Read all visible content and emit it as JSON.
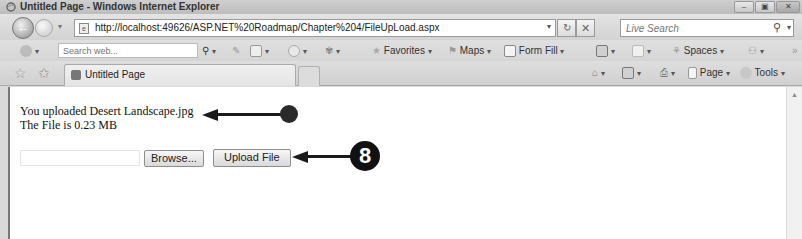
{
  "window": {
    "title": "Untitled Page - Windows Internet Explorer",
    "controls": {
      "minimize": "–",
      "maximize": "▣",
      "close": "✕"
    }
  },
  "address_bar": {
    "url": "http://localhost:49626/ASP.NET%20Roadmap/Chapter%204/FileUpLoad.aspx",
    "refresh_icon": "refresh-icon",
    "stop_icon": "stop-icon",
    "refresh_glyph": "↻",
    "stop_glyph": "✕",
    "dropdown_glyph": "▾"
  },
  "live_search": {
    "placeholder": "Live Search",
    "search_glyph": "⚲",
    "dropdown_glyph": "▾"
  },
  "toolbar": {
    "web_search_placeholder": "Search web...",
    "favorites_label": "Favorites",
    "maps_label": "Maps",
    "form_fill_label": "Form Fill",
    "spaces_label": "Spaces",
    "star_glyph": "★",
    "dropdown_glyph": "▾"
  },
  "tabs": {
    "favorites_center_glyph": "☆",
    "add_favorites_glyph": "✩",
    "items": [
      {
        "label": "Untitled Page",
        "active": true
      }
    ]
  },
  "command_bar": {
    "page_label": "Page",
    "tools_label": "Tools",
    "dropdown_glyph": "▾"
  },
  "content": {
    "uploaded_message": "You uploaded Desert Landscape.jpg",
    "size_message": "The File is 0.23 MB",
    "file_input_value": "",
    "browse_label": "Browse...",
    "upload_label": "Upload File"
  },
  "callouts": {
    "step_number": "8",
    "colors": {
      "annotation": "#1a1a1a"
    }
  },
  "scrollbar": {
    "up_glyph": "▲"
  }
}
